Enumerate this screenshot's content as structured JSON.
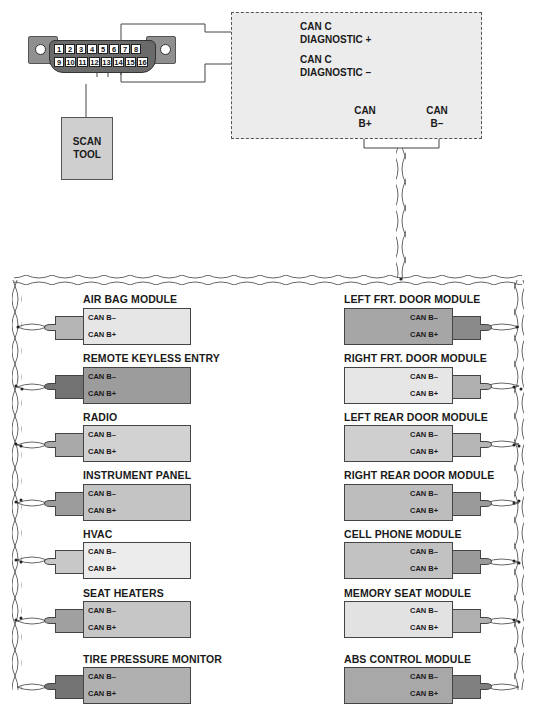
{
  "connector": {
    "pins_top": [
      "1",
      "2",
      "3",
      "4",
      "5",
      "6",
      "7",
      "8"
    ],
    "pins_bottom": [
      "9",
      "10",
      "11",
      "12",
      "13",
      "14",
      "15",
      "16"
    ]
  },
  "scan_tool": {
    "line1": "SCAN",
    "line2": "TOOL"
  },
  "gateway": {
    "diag_plus_1": "CAN C",
    "diag_plus_2": "DIAGNOSTIC +",
    "diag_minus_1": "CAN C",
    "diag_minus_2": "DIAGNOSTIC –",
    "canb_plus_1": "CAN",
    "canb_plus_2": "B+",
    "canb_minus_1": "CAN",
    "canb_minus_2": "B–"
  },
  "pin_labels": {
    "minus": "CAN B–",
    "plus": "CAN B+"
  },
  "modules_left": [
    {
      "name": "AIR BAG MODULE",
      "fill": "#e6e6e6",
      "plug": "#b5b5b5"
    },
    {
      "name": "REMOTE KEYLESS ENTRY",
      "fill": "#9c9c9c",
      "plug": "#727272"
    },
    {
      "name": "RADIO",
      "fill": "#d2d2d2",
      "plug": "#a9a9a9"
    },
    {
      "name": "INSTRUMENT PANEL",
      "fill": "#c4c4c4",
      "plug": "#9c9c9c"
    },
    {
      "name": "HVAC",
      "fill": "#ececec",
      "plug": "#c8c8c8"
    },
    {
      "name": "SEAT HEATERS",
      "fill": "#c6c6c6",
      "plug": "#a0a0a0"
    },
    {
      "name": "TIRE PRESSURE MONITOR",
      "fill": "#b0b0b0",
      "plug": "#747474"
    }
  ],
  "modules_right": [
    {
      "name": "LEFT FRT. DOOR MODULE",
      "fill": "#a6a6a6",
      "plug": "#8a8a8a"
    },
    {
      "name": "RIGHT FRT. DOOR MODULE",
      "fill": "#e6e6e6",
      "plug": "#b0b0b0"
    },
    {
      "name": "LEFT REAR DOOR MODULE",
      "fill": "#cfcfcf",
      "plug": "#b6b6b6"
    },
    {
      "name": "RIGHT REAR DOOR MODULE",
      "fill": "#bdbdbd",
      "plug": "#9a9a9a"
    },
    {
      "name": "CELL PHONE MODULE",
      "fill": "#c2c2c2",
      "plug": "#9a9a9a"
    },
    {
      "name": "MEMORY SEAT MODULE",
      "fill": "#e2e2e2",
      "plug": "#b0b0b0"
    },
    {
      "name": "ABS CONTROL MODULE",
      "fill": "#a8a8a8",
      "plug": "#808080"
    }
  ],
  "colors": {
    "line": "#444444",
    "gateway_fill": "#ececec",
    "scan_fill": "#cfcfcf",
    "connector": "#8f8f8f"
  }
}
